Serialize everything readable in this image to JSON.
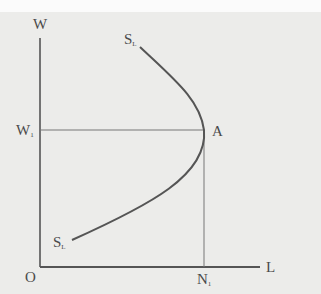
{
  "diagram": {
    "axes": {
      "y_label": "W",
      "x_label": "L",
      "origin_label": "O"
    },
    "curve": {
      "name": "S",
      "subscript": "L",
      "top_label": "S",
      "top_label_sub": "L",
      "bottom_label": "S",
      "bottom_label_sub": "L"
    },
    "point": {
      "label": "A"
    },
    "wage_level": {
      "label": "W",
      "subscript": "1"
    },
    "labour_level": {
      "label": "N",
      "subscript": "1"
    },
    "colors": {
      "background": "#ececea",
      "line": "#555555",
      "text": "#4a4a4a"
    }
  }
}
